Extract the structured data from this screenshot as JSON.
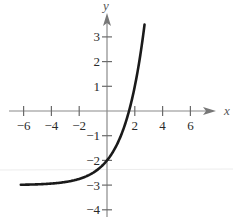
{
  "chart_data": {
    "type": "line",
    "title": "",
    "function": "y = 2^x - 3",
    "xlabel": "x",
    "ylabel": "y",
    "xlim": [
      -6.2,
      7.3
    ],
    "ylim": [
      -4.2,
      3.9
    ],
    "x_ticks": [
      -6,
      -4,
      -2,
      2,
      4,
      6
    ],
    "x_tick_labels": [
      "−6",
      "−4",
      "−2",
      "2",
      "4",
      "6"
    ],
    "y_ticks": [
      3,
      2,
      1,
      -1,
      -2,
      -3,
      -4
    ],
    "y_tick_labels": [
      "3",
      "2",
      "1",
      "−1",
      "−2",
      "−3",
      "−4"
    ],
    "grid": false,
    "legend": null,
    "asymptote": -3,
    "y_intercept": -2,
    "x_intercept": 1.585,
    "series": [
      {
        "name": "f(x)",
        "x": [
          -6,
          -5,
          -4,
          -3,
          -2,
          -1,
          0,
          0.5,
          1,
          1.5,
          1.585,
          2,
          2.3,
          2.6,
          2.7
        ],
        "values": [
          -2.98,
          -2.97,
          -2.94,
          -2.88,
          -2.75,
          -2.5,
          -2,
          -1.59,
          -1,
          -0.17,
          0,
          1,
          1.92,
          3.06,
          3.5
        ]
      }
    ],
    "colors": {
      "curve": "#1a1a1a",
      "axes": "#8a8a8a",
      "text": "#2a2a2a"
    }
  }
}
